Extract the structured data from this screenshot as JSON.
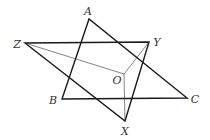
{
  "diagram": {
    "type": "geometry",
    "colors": {
      "thick_line": "#1a1a1a",
      "thin_line": "#333333",
      "label": "#333333",
      "background": "#ffffff"
    },
    "points": {
      "A": {
        "label": "A",
        "x": 89,
        "y": 19,
        "lx": 88,
        "ly": 11
      },
      "B": {
        "label": "B",
        "x": 62,
        "y": 99,
        "lx": 53,
        "ly": 100
      },
      "C": {
        "label": "C",
        "x": 187,
        "y": 98,
        "lx": 195,
        "ly": 99
      },
      "X": {
        "label": "X",
        "x": 125,
        "y": 121,
        "lx": 125,
        "ly": 131
      },
      "Y": {
        "label": "Y",
        "x": 149,
        "y": 42,
        "lx": 157,
        "ly": 42
      },
      "Z": {
        "label": "Z",
        "x": 25,
        "y": 43,
        "lx": 17,
        "ly": 44
      },
      "O": {
        "label": "O",
        "x": 124,
        "y": 74,
        "lx": 117,
        "ly": 80
      }
    },
    "triangles": [
      {
        "name": "ABC",
        "vertices": [
          "A",
          "B",
          "C"
        ]
      },
      {
        "name": "XYZ",
        "vertices": [
          "X",
          "Y",
          "Z"
        ]
      }
    ],
    "segments": [
      {
        "name": "OZ",
        "from": "O",
        "to": "Z"
      },
      {
        "name": "OY",
        "from": "O",
        "to": "Y"
      },
      {
        "name": "OX",
        "from": "O",
        "to": "X"
      }
    ]
  }
}
